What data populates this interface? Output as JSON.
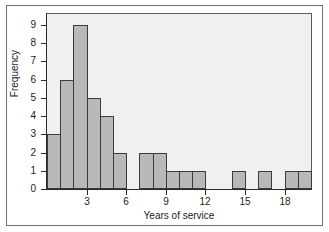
{
  "chart_data": {
    "type": "bar",
    "title": "",
    "subtitle": "",
    "xlabel": "Years of service",
    "ylabel": "Frequency",
    "xlim": [
      0,
      20
    ],
    "ylim": [
      0,
      9.6
    ],
    "grid": false,
    "legend": null,
    "bin_width": 1,
    "bin_starts": [
      0,
      1,
      2,
      3,
      4,
      5,
      6,
      7,
      8,
      9,
      10,
      11,
      12,
      13,
      14,
      15,
      16,
      17,
      18,
      19
    ],
    "categories": [
      "0-1",
      "1-2",
      "2-3",
      "3-4",
      "4-5",
      "5-6",
      "6-7",
      "7-8",
      "8-9",
      "9-10",
      "10-11",
      "11-12",
      "12-13",
      "13-14",
      "14-15",
      "15-16",
      "16-17",
      "17-18",
      "18-19",
      "19-20"
    ],
    "values": [
      3,
      6,
      9,
      5,
      4,
      2,
      0,
      2,
      2,
      1,
      1,
      1,
      0,
      0,
      1,
      0,
      1,
      0,
      1,
      1
    ],
    "xticks": [
      3,
      6,
      9,
      12,
      15,
      18
    ],
    "xtick_labels": [
      "3",
      "6",
      "9",
      "12",
      "15",
      "18"
    ],
    "yticks": [
      0,
      1,
      2,
      3,
      4,
      5,
      6,
      7,
      8,
      9
    ],
    "ytick_labels": [
      "0",
      "1",
      "2",
      "3",
      "4",
      "5",
      "6",
      "7",
      "8",
      "9"
    ],
    "colors": {
      "bar_fill": "#b9b9b9",
      "bar_edge": "#3b3b3b",
      "panel_background": "#f0f0ef",
      "panel_border": "#5a5a5a",
      "axis": "#2a2a2a",
      "text": "#1b1b1b",
      "figure_background": "#ffffff",
      "outer_frame": "#6f6f6f"
    }
  }
}
